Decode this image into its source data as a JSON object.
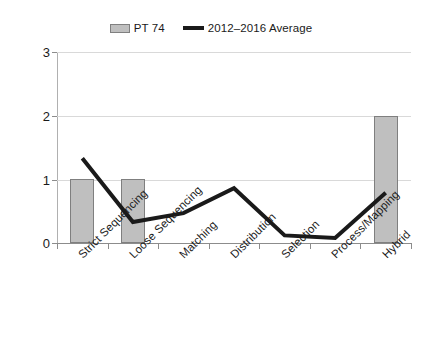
{
  "chart_data": {
    "type": "bar",
    "title": "",
    "subtitle": "",
    "xlabel": "",
    "ylabel": "",
    "ylim": [
      0,
      3
    ],
    "yticks": [
      0,
      1,
      2,
      3
    ],
    "grid": true,
    "legend_position": "top-center",
    "categories": [
      "Strict Sequencing",
      "Loose Sequencing",
      "Matching",
      "Distribution",
      "Selection",
      "Process/Mapping",
      "Hybrid"
    ],
    "series": [
      {
        "name": "PT 74",
        "type": "bar",
        "color": "#BFBFBF",
        "values": [
          1,
          1,
          0,
          0,
          0,
          0,
          2
        ]
      },
      {
        "name": "2012–2016 Average",
        "type": "line",
        "color": "#1A1A1A",
        "values": [
          1.33,
          0.33,
          0.47,
          0.86,
          0.12,
          0.08,
          0.79
        ]
      }
    ]
  },
  "legend": {
    "entries": [
      {
        "label": "PT 74",
        "marker": "bar-swatch"
      },
      {
        "label": "2012–2016 Average",
        "marker": "line-swatch"
      }
    ]
  },
  "axes": {
    "y": {
      "ticks": [
        "0",
        "1",
        "2",
        "3"
      ]
    },
    "x": {
      "ticks": [
        "Strict Sequencing",
        "Loose Sequencing",
        "Matching",
        "Distribution",
        "Selection",
        "Process/Mapping",
        "Hybrid"
      ]
    }
  },
  "colors": {
    "bar_fill": "#BFBFBF",
    "bar_border": "#7F7F7F",
    "line": "#1A1A1A",
    "gridline": "#D9D9D9",
    "axis": "#8C8C8C",
    "text": "#1A1A1A",
    "background": "#FFFFFF"
  }
}
